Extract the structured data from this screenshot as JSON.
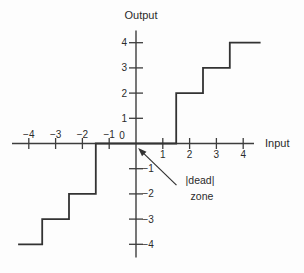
{
  "chart_data": {
    "type": "line",
    "title": "",
    "xlabel": "Input",
    "ylabel": "Output",
    "xlim": [
      -4.7,
      4.4
    ],
    "ylim": [
      -4.5,
      4.55
    ],
    "grid": false,
    "x_ticks": [
      -4,
      -3,
      -2,
      -1,
      0,
      1,
      2,
      3,
      4
    ],
    "y_ticks": [
      -4,
      -3,
      -2,
      -1,
      1,
      2,
      3,
      4
    ],
    "series": [
      {
        "name": "quantizer-staircase",
        "points": [
          [
            -4.4,
            -4
          ],
          [
            -3.5,
            -4
          ],
          [
            -3.5,
            -3
          ],
          [
            -2.5,
            -3
          ],
          [
            -2.5,
            -2
          ],
          [
            -1.5,
            -2
          ],
          [
            -1.5,
            0
          ],
          [
            1.5,
            0
          ],
          [
            1.5,
            2
          ],
          [
            2.5,
            2
          ],
          [
            2.5,
            3
          ],
          [
            3.5,
            3
          ],
          [
            3.5,
            4
          ],
          [
            4.65,
            4
          ]
        ]
      }
    ],
    "annotation": {
      "line1": "|dead|",
      "line2": "zone",
      "arrow_from": [
        1.51,
        -1.65
      ],
      "arrow_to": [
        0.08,
        -0.18
      ]
    },
    "line_color": "#333333",
    "axis_color": "#3d3d3d",
    "text_color": "#2b2b2b"
  }
}
